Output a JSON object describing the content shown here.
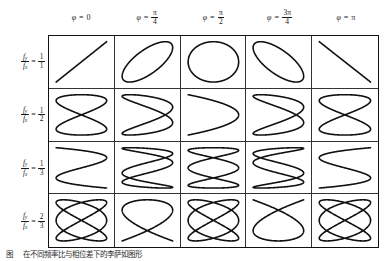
{
  "figure": {
    "caption_label": "图",
    "caption_text": "在不同频率比与相位差下的李萨如图形"
  },
  "table": {
    "column_headers": [
      {
        "symbol": "φ",
        "equals": "=",
        "value_text": "0",
        "numerator": null,
        "denominator": null
      },
      {
        "symbol": "φ",
        "equals": "=",
        "value_text": null,
        "numerator": "π",
        "denominator": "4"
      },
      {
        "symbol": "φ",
        "equals": "=",
        "value_text": null,
        "numerator": "π",
        "denominator": "2"
      },
      {
        "symbol": "φ",
        "equals": "=",
        "value_text": null,
        "numerator": "3π",
        "denominator": "4"
      },
      {
        "symbol": "φ",
        "equals": "=",
        "value_text": "π",
        "numerator": null,
        "denominator": null
      }
    ],
    "row_headers": [
      {
        "lhs_num": "f",
        "lhs_num_sub": "y",
        "lhs_den": "f",
        "lhs_den_sub": "x",
        "equals": "=",
        "rhs_num": "1",
        "rhs_den": "1"
      },
      {
        "lhs_num": "f",
        "lhs_num_sub": "y",
        "lhs_den": "f",
        "lhs_den_sub": "x",
        "equals": "=",
        "rhs_num": "1",
        "rhs_den": "2"
      },
      {
        "lhs_num": "f",
        "lhs_num_sub": "y",
        "lhs_den": "f",
        "lhs_den_sub": "x",
        "equals": "=",
        "rhs_num": "1",
        "rhs_den": "3"
      },
      {
        "lhs_num": "f",
        "lhs_num_sub": "y",
        "lhs_den": "f",
        "lhs_den_sub": "x",
        "equals": "=",
        "rhs_num": "2",
        "rhs_den": "3"
      }
    ]
  },
  "chart_data": {
    "type": "line",
    "xlabel": "φ (phase difference)",
    "ylabel": "f_y / f_x (frequency ratio)",
    "grid": true,
    "legend": "none",
    "xlim": [
      -1,
      1
    ],
    "ylim": [
      -1,
      1
    ],
    "parametric_form": "x(t) = sin(a*t + phi), y(t) = sin(b*t)",
    "phases": [
      {
        "label": "φ = 0",
        "radians": 0.0
      },
      {
        "label": "φ = π/4",
        "radians": 0.7853981634
      },
      {
        "label": "φ = π/2",
        "radians": 1.5707963268
      },
      {
        "label": "φ = 3π/4",
        "radians": 2.3561944902
      },
      {
        "label": "φ = π",
        "radians": 3.1415926536
      }
    ],
    "ratios": [
      {
        "label": "1/1",
        "fy": 1,
        "fx": 1,
        "a": 1,
        "b": 1
      },
      {
        "label": "1/2",
        "fy": 1,
        "fx": 2,
        "a": 2,
        "b": 1
      },
      {
        "label": "1/3",
        "fy": 1,
        "fx": 3,
        "a": 3,
        "b": 1
      },
      {
        "label": "2/3",
        "fy": 2,
        "fx": 3,
        "a": 3,
        "b": 2
      }
    ],
    "cells": [
      {
        "row": 0,
        "col": 0,
        "a": 1,
        "b": 1,
        "phi": 0.0,
        "shape": "diagonal line (rising)"
      },
      {
        "row": 0,
        "col": 1,
        "a": 1,
        "b": 1,
        "phi": 0.7853981634,
        "shape": "tilted ellipse (rising)"
      },
      {
        "row": 0,
        "col": 2,
        "a": 1,
        "b": 1,
        "phi": 1.5707963268,
        "shape": "circle"
      },
      {
        "row": 0,
        "col": 3,
        "a": 1,
        "b": 1,
        "phi": 2.3561944902,
        "shape": "tilted ellipse (falling)"
      },
      {
        "row": 0,
        "col": 4,
        "a": 1,
        "b": 1,
        "phi": 3.1415926536,
        "shape": "diagonal line (falling)"
      },
      {
        "row": 1,
        "col": 0,
        "a": 2,
        "b": 1,
        "phi": 0.0,
        "shape": "figure eight"
      },
      {
        "row": 1,
        "col": 1,
        "a": 2,
        "b": 1,
        "phi": 0.7853981634,
        "shape": "overlapping arcs"
      },
      {
        "row": 1,
        "col": 2,
        "a": 2,
        "b": 1,
        "phi": 1.5707963268,
        "shape": "parabolic arc"
      },
      {
        "row": 1,
        "col": 3,
        "a": 2,
        "b": 1,
        "phi": 2.3561944902,
        "shape": "overlapping arcs (mirrored)"
      },
      {
        "row": 1,
        "col": 4,
        "a": 2,
        "b": 1,
        "phi": 3.1415926536,
        "shape": "figure eight"
      },
      {
        "row": 2,
        "col": 0,
        "a": 3,
        "b": 1,
        "phi": 0.0,
        "shape": "three lobe wave"
      },
      {
        "row": 2,
        "col": 1,
        "a": 3,
        "b": 1,
        "phi": 0.7853981634,
        "shape": "three lobe crossing"
      },
      {
        "row": 2,
        "col": 2,
        "a": 3,
        "b": 1,
        "phi": 1.5707963268,
        "shape": "double loop chain"
      },
      {
        "row": 2,
        "col": 3,
        "a": 3,
        "b": 1,
        "phi": 2.3561944902,
        "shape": "three lobe crossing (mirrored)"
      },
      {
        "row": 2,
        "col": 4,
        "a": 3,
        "b": 1,
        "phi": 3.1415926536,
        "shape": "three lobe wave (mirrored)"
      },
      {
        "row": 3,
        "col": 0,
        "a": 3,
        "b": 2,
        "phi": 0.0,
        "shape": "woven braid"
      },
      {
        "row": 3,
        "col": 1,
        "a": 3,
        "b": 2,
        "phi": 0.7853981634,
        "shape": "open loop with crossing"
      },
      {
        "row": 3,
        "col": 2,
        "a": 3,
        "b": 2,
        "phi": 1.5707963268,
        "shape": "woven braid"
      },
      {
        "row": 3,
        "col": 3,
        "a": 3,
        "b": 2,
        "phi": 2.3561944902,
        "shape": "open loop with crossing (mirrored)"
      },
      {
        "row": 3,
        "col": 4,
        "a": 3,
        "b": 2,
        "phi": 3.1415926536,
        "shape": "woven braid"
      }
    ]
  }
}
